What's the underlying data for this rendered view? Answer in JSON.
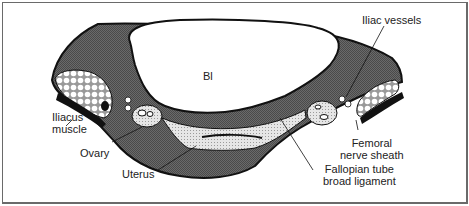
{
  "diagram": {
    "type": "anatomical-cross-section",
    "structures": {
      "bladder": "Bl"
    },
    "labels": {
      "iliac_vessels": "Iliac vessels",
      "iliacus_muscle_line1": "Iliacus",
      "iliacus_muscle_line2": "muscle",
      "ovary": "Ovary",
      "uterus": "Uterus",
      "femoral_line1": "Femoral",
      "femoral_line2": "nerve sheath",
      "fallopian_line1": "Fallopian tube",
      "fallopian_line2": "broad ligament"
    },
    "colors": {
      "dark_tissue": "#5a5a5a",
      "outline": "#111111",
      "dotted_fill": "#d8d8d8",
      "bladder": "#ffffff",
      "frame": "#6a6a6a"
    }
  }
}
